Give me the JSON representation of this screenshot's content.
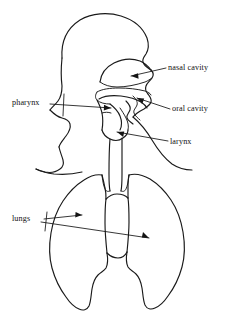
{
  "figure": {
    "background_color": "#ffffff",
    "line_color": "#1a1a1a",
    "text_color": "#111111"
  },
  "labels": {
    "nasal_cavity": "nasal cavity",
    "pharynx": "pharynx",
    "oral_cavity": "oral cavity",
    "larynx": "larynx",
    "lungs": "lungs"
  },
  "parts": {
    "head": "head-outline",
    "nasal_cavity": "nasal-cavity-outline",
    "palate": "palate-outline",
    "tongue": "tongue-outline",
    "oral_cavity": "oral-cavity-outline",
    "pharynx": "pharynx-outline",
    "larynx": "larynx-outline",
    "trachea": "trachea-outline",
    "neck": "neck-outline",
    "shoulders": "shoulder-outline",
    "left_lung": "left-lung-outline",
    "right_lung": "right-lung-outline",
    "heart_notch": "heart-notch-outline"
  },
  "leaders": {
    "nasal_cavity": "arrow-to-nasal-cavity",
    "pharynx": "arrow-to-pharynx",
    "oral_cavity": "arrow-to-oral-cavity",
    "larynx": "arrow-to-larynx",
    "lungs_left": "arrow-to-left-lung",
    "lungs_right": "arrow-to-right-lung"
  }
}
